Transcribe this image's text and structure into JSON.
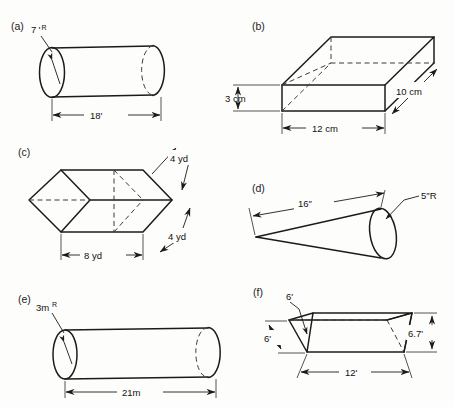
{
  "page": {
    "background_color": "#fdfdfb",
    "ink_color": "#1b1b1b"
  },
  "figures": [
    {
      "id": "a",
      "label": "(a)",
      "shape": "cylinder",
      "orientation": "horizontal",
      "dimensions": [
        {
          "name": "radius",
          "value": "7",
          "unit_symbol": "'",
          "superscript": "R",
          "text": "7'R"
        },
        {
          "name": "length",
          "value": "18",
          "unit_symbol": "'",
          "superscript": "",
          "text": "18'"
        }
      ]
    },
    {
      "id": "b",
      "label": "(b)",
      "shape": "rectangular-box",
      "orientation": "isometric",
      "dimensions": [
        {
          "name": "height",
          "value": "3",
          "unit_symbol": " cm",
          "superscript": "",
          "text": "3 cm"
        },
        {
          "name": "depth",
          "value": "10",
          "unit_symbol": " cm",
          "superscript": "",
          "text": "10 cm"
        },
        {
          "name": "width",
          "value": "12",
          "unit_symbol": " cm",
          "superscript": "",
          "text": "12 cm"
        }
      ]
    },
    {
      "id": "c",
      "label": "(c)",
      "shape": "hexagonal-prism",
      "orientation": "axial",
      "dimensions": [
        {
          "name": "upper-edge",
          "value": "4",
          "unit_symbol": " yd",
          "superscript": "",
          "text": "4 yd"
        },
        {
          "name": "lower-edge",
          "value": "4",
          "unit_symbol": " yd",
          "superscript": "",
          "text": "4 yd"
        },
        {
          "name": "width",
          "value": "8",
          "unit_symbol": " yd",
          "superscript": "",
          "text": "8 yd"
        }
      ]
    },
    {
      "id": "d",
      "label": "(d)",
      "shape": "cone",
      "orientation": "tilted",
      "dimensions": [
        {
          "name": "length",
          "value": "16",
          "unit_symbol": "\"",
          "superscript": "",
          "text": "16\""
        },
        {
          "name": "radius",
          "value": "5",
          "unit_symbol": "\"",
          "superscript": "R",
          "text": "5\"R"
        }
      ]
    },
    {
      "id": "e",
      "label": "(e)",
      "shape": "cylinder",
      "orientation": "horizontal",
      "dimensions": [
        {
          "name": "radius",
          "value": "3m",
          "unit_symbol": "",
          "superscript": "R",
          "text": "3mR"
        },
        {
          "name": "length",
          "value": "21m",
          "unit_symbol": "",
          "superscript": "",
          "text": "21m"
        }
      ]
    },
    {
      "id": "f",
      "label": "(f)",
      "shape": "triangular-prism",
      "orientation": "isometric",
      "dimensions": [
        {
          "name": "top-edge",
          "value": "6",
          "unit_symbol": "'",
          "superscript": "",
          "text": "6'"
        },
        {
          "name": "left-edge",
          "value": "6",
          "unit_symbol": "'",
          "superscript": "",
          "text": "6'"
        },
        {
          "name": "height",
          "value": "6.7",
          "unit_symbol": "'",
          "superscript": "",
          "text": "6.7'"
        },
        {
          "name": "length",
          "value": "12",
          "unit_symbol": "'",
          "superscript": "",
          "text": "12'"
        }
      ]
    }
  ],
  "labels": {
    "a_label": "(a)",
    "a_radius": "7",
    "a_radius_sup": "R",
    "a_length": "18'",
    "b_label": "(b)",
    "b_height": "3 cm",
    "b_depth": "10 cm",
    "b_width": "12 cm",
    "c_label": "(c)",
    "c_edge_top": "4 yd",
    "c_edge_bottom": "4 yd",
    "c_width": "8 yd",
    "d_label": "(d)",
    "d_length": "16″",
    "d_radius": "5″R",
    "e_label": "(e)",
    "e_radius": "3m",
    "e_radius_sup": "R",
    "e_length": "21m",
    "f_label": "(f)",
    "f_top": "6'",
    "f_left": "6'",
    "f_height": "6.7'",
    "f_length": "12'"
  }
}
